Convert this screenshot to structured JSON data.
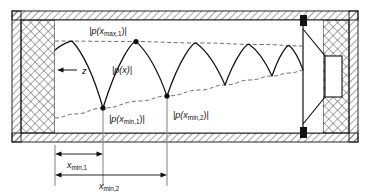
{
  "figure": {
    "kind": "acoustic-standing-wave-duct-diagram",
    "background_color": "#ffffff",
    "line_color": "#111111",
    "dashed_envelope_color": "#555555",
    "reference_line_color": "#8c8c8c",
    "wall_hatch_color": "#333333"
  },
  "labels": {
    "p_max_1": "|p(xmax,1)|",
    "p_max_1_parts": {
      "pre": "|p(x",
      "sub": "max,1",
      "post": ")|"
    },
    "p_of_x": "|p(x)|",
    "p_of_x_parts": {
      "pre": "|p(x)|"
    },
    "p_min_1": "|p(xmin,1)|",
    "p_min_1_parts": {
      "pre": "|p(x",
      "sub": "min,1",
      "post": ")|"
    },
    "p_min_2": "|p(xmin,2)|",
    "p_min_2_parts": {
      "pre": "|p(x",
      "sub": "min,2",
      "post": ")|"
    },
    "axis_z": "z",
    "dim_x_min_1": "xmin,1",
    "dim_x_min_1_parts": {
      "pre": "x",
      "sub": "min,1"
    },
    "dim_x_min_2": "xmin,2",
    "dim_x_min_2_parts": {
      "pre": "x",
      "sub": "min,2"
    }
  },
  "chart_data": {
    "type": "line",
    "title": "",
    "xlabel": "z",
    "ylabel": "|p(x)|",
    "grid": false,
    "legend": null,
    "axis_ranges": {
      "x_px": [
        55,
        305
      ],
      "y_px": [
        39,
        118
      ]
    },
    "upper_envelope": {
      "label": "|p(xmax,1)| envelope",
      "style": "dashed",
      "points_px": [
        [
          55,
          41
        ],
        [
          130,
          41.5
        ],
        [
          200,
          43
        ],
        [
          260,
          44.5
        ],
        [
          305,
          46
        ]
      ]
    },
    "lower_envelope": {
      "label": "|p(xmin)| envelope",
      "style": "dashed",
      "points_px": [
        [
          55,
          118
        ],
        [
          75,
          114
        ],
        [
          103,
          108
        ],
        [
          140,
          101
        ],
        [
          167,
          96
        ],
        [
          200,
          90
        ],
        [
          225,
          85
        ],
        [
          250,
          80
        ],
        [
          272,
          76
        ],
        [
          290,
          73
        ],
        [
          305,
          70
        ]
      ]
    },
    "pressure_curve": {
      "label": "|p(x)|",
      "style": "solid",
      "minima_px": [
        [
          103,
          108
        ],
        [
          167,
          96
        ],
        [
          225,
          85
        ],
        [
          272,
          76
        ],
        [
          303,
          70
        ]
      ],
      "maxima_px": [
        [
          72,
          41
        ],
        [
          136,
          41.6
        ],
        [
          196,
          42.9
        ],
        [
          249,
          44.2
        ],
        [
          289,
          45.3
        ]
      ],
      "left_start_px": [
        55,
        50
      ]
    },
    "markers": [
      {
        "name": "p_max_1_dot",
        "x_px": 136,
        "y_px": 41.6,
        "label_ref": "p_max_1"
      },
      {
        "name": "p_min_1_dot",
        "x_px": 103,
        "y_px": 108,
        "label_ref": "p_min_1"
      },
      {
        "name": "p_min_2_dot",
        "x_px": 167,
        "y_px": 96,
        "label_ref": "p_min_2"
      }
    ],
    "reference_lines_px": [
      {
        "name": "ref-line-x-min-1",
        "x": 103,
        "y_top": 108,
        "y_bottom": 186
      },
      {
        "name": "ref-line-x-min-2",
        "x": 167,
        "y_top": 96,
        "y_bottom": 186
      },
      {
        "name": "ref-line-origin",
        "x": 55,
        "y_top": 145,
        "y_bottom": 186
      }
    ],
    "dimensions_px": [
      {
        "name": "x_min_1",
        "label_ref": "dim_x_min_1",
        "x_start": 55,
        "x_end": 103,
        "y": 154
      },
      {
        "name": "x_min_2",
        "label_ref": "dim_x_min_2",
        "x_start": 55,
        "x_end": 167,
        "y": 175
      }
    ]
  },
  "geometry_px": {
    "outer_frame": {
      "x": 12,
      "y": 11,
      "w": 346,
      "h": 131,
      "wall_thickness": 9
    },
    "left_wall_block": {
      "x": 21,
      "y": 20,
      "w": 34,
      "h": 113
    },
    "right_wall_block": {
      "x": 323,
      "y": 20,
      "w": 26,
      "h": 113
    },
    "duct_cavity": {
      "x": 55,
      "y": 20,
      "w": 268,
      "h": 113
    },
    "speaker": {
      "baffle_x": 303,
      "baffle_y_top": 20,
      "baffle_y_bottom": 133,
      "top_mount_px": {
        "x": 300,
        "y": 17,
        "w": 7,
        "h": 9
      },
      "bottom_mount_px": {
        "x": 300,
        "y": 127,
        "w": 7,
        "h": 9
      },
      "cone_points_px": "303,29 325,56 325,97 303,124",
      "magnet_px": {
        "x": 325,
        "y": 56,
        "w": 17,
        "h": 41
      }
    },
    "z_arrow": {
      "x_tail": 75,
      "x_head": 58,
      "y": 70,
      "label_x": 82,
      "label_y": 73
    }
  }
}
